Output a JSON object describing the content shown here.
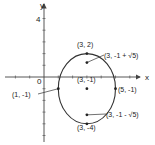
{
  "diagram": {
    "type": "ellipse-graph",
    "equation_center": "(3, -1)",
    "axes": {
      "x_label": "x",
      "y_label": "y",
      "origin_label": "0",
      "y_tick_label": "4"
    },
    "ellipse": {
      "center": [
        3,
        -1
      ],
      "semi_axis_x": 2,
      "semi_axis_y": 3
    },
    "points": [
      {
        "name": "top-vertex",
        "x": 3,
        "y": 2,
        "label": "(3, 2)"
      },
      {
        "name": "upper-focus",
        "x": 3,
        "y": 1.236,
        "label": "(3, -1 + √5)"
      },
      {
        "name": "center",
        "x": 3,
        "y": -1,
        "label": "(3, -1)"
      },
      {
        "name": "left-vertex",
        "x": 1,
        "y": -1,
        "label": "(1, -1)"
      },
      {
        "name": "right-vertex",
        "x": 5,
        "y": -1,
        "label": "(5, -1)"
      },
      {
        "name": "lower-focus",
        "x": 3,
        "y": -3.236,
        "label": "(3, -1 - √5)"
      },
      {
        "name": "bottom-vertex",
        "x": 3,
        "y": -4,
        "label": "(3, -4)"
      }
    ],
    "colors": {
      "line": "#333333",
      "background": "#ffffff"
    }
  }
}
